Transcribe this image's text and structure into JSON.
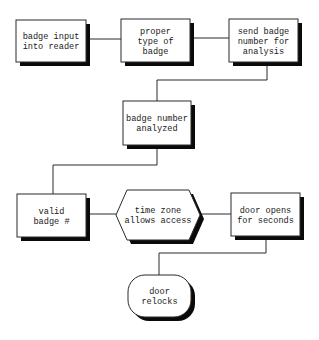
{
  "diagram": {
    "type": "flowchart",
    "nodes": [
      {
        "id": "n1",
        "shape": "rectangle",
        "lines": [
          "badge input",
          "into reader"
        ]
      },
      {
        "id": "n2",
        "shape": "rectangle",
        "lines": [
          "proper",
          "type of",
          "badge"
        ]
      },
      {
        "id": "n3",
        "shape": "rectangle",
        "lines": [
          "send badge",
          "number for",
          "analysis"
        ]
      },
      {
        "id": "n4",
        "shape": "rectangle",
        "lines": [
          "badge number",
          "analyzed"
        ]
      },
      {
        "id": "n5",
        "shape": "rectangle",
        "lines": [
          "valid",
          "badge #"
        ]
      },
      {
        "id": "n6",
        "shape": "hexagon",
        "lines": [
          "time zone",
          "allows access"
        ]
      },
      {
        "id": "n7",
        "shape": "rectangle",
        "lines": [
          "door opens",
          "for seconds"
        ]
      },
      {
        "id": "n8",
        "shape": "rounded",
        "lines": [
          "door",
          "relocks"
        ]
      }
    ],
    "edges": [
      {
        "from": "n1",
        "to": "n2"
      },
      {
        "from": "n2",
        "to": "n3"
      },
      {
        "from": "n3",
        "to": "n4"
      },
      {
        "from": "n4",
        "to": "n5"
      },
      {
        "from": "n5",
        "to": "n6"
      },
      {
        "from": "n6",
        "to": "n7"
      },
      {
        "from": "n7",
        "to": "n8"
      }
    ],
    "colors": {
      "line": "#2a2a2a",
      "shadow": "#0a0a0a",
      "fill": "#ffffff"
    }
  }
}
